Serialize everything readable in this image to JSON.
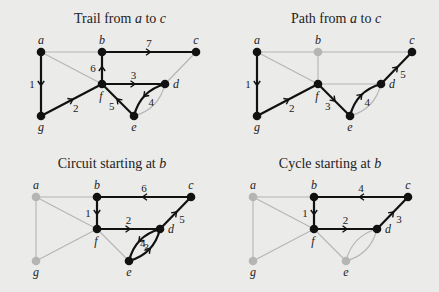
{
  "colors": {
    "background": "#ebebea",
    "active": "#111111",
    "inactive": "#b5b5b5"
  },
  "panels": [
    {
      "id": "trail",
      "title_prefix": "Trail from ",
      "title_var1": "a",
      "title_mid": " to ",
      "title_var2": "c",
      "offset": [
        0,
        0
      ],
      "active_nodes": [
        "a",
        "b",
        "c",
        "d",
        "e",
        "f",
        "g"
      ],
      "steps": [
        {
          "n": "1",
          "from": "a",
          "to": "g",
          "edge": "a-g"
        },
        {
          "n": "2",
          "from": "g",
          "to": "f",
          "edge": "g-f"
        },
        {
          "n": "3",
          "from": "f",
          "to": "d",
          "edge": "f-d"
        },
        {
          "n": "4",
          "from": "d",
          "to": "e",
          "edge": "d-e-lower"
        },
        {
          "n": "5",
          "from": "e",
          "to": "f",
          "edge": "f-e"
        },
        {
          "n": "6",
          "from": "f",
          "to": "b",
          "edge": "b-f"
        },
        {
          "n": "7",
          "from": "b",
          "to": "c",
          "edge": "b-c"
        }
      ]
    },
    {
      "id": "path",
      "title_prefix": "Path from ",
      "title_var1": "a",
      "title_mid": " to ",
      "title_var2": "c",
      "offset": [
        216,
        0
      ],
      "active_nodes": [
        "a",
        "c",
        "d",
        "e",
        "f",
        "g"
      ],
      "steps": [
        {
          "n": "1",
          "from": "a",
          "to": "g",
          "edge": "a-g"
        },
        {
          "n": "2",
          "from": "g",
          "to": "f",
          "edge": "g-f"
        },
        {
          "n": "3",
          "from": "f",
          "to": "e",
          "edge": "f-e"
        },
        {
          "n": "4",
          "from": "e",
          "to": "d",
          "edge": "d-e-lower"
        },
        {
          "n": "5",
          "from": "d",
          "to": "c",
          "edge": "d-c"
        }
      ]
    },
    {
      "id": "circuit",
      "title_prefix": "Circuit starting at ",
      "title_var1": "b",
      "title_mid": "",
      "title_var2": "",
      "offset": [
        -5,
        145
      ],
      "active_nodes": [
        "b",
        "c",
        "d",
        "e",
        "f"
      ],
      "steps": [
        {
          "n": "1",
          "from": "b",
          "to": "f",
          "edge": "b-f"
        },
        {
          "n": "2",
          "from": "f",
          "to": "d",
          "edge": "f-d"
        },
        {
          "n": "3",
          "from": "d",
          "to": "e",
          "edge": "d-e-lower"
        },
        {
          "n": "4",
          "from": "e",
          "to": "d",
          "edge": "d-e-upper"
        },
        {
          "n": "5",
          "from": "d",
          "to": "c",
          "edge": "d-c"
        },
        {
          "n": "6",
          "from": "c",
          "to": "b",
          "edge": "b-c"
        }
      ]
    },
    {
      "id": "cycle",
      "title_prefix": "Cycle starting at ",
      "title_var1": "b",
      "title_mid": "",
      "title_var2": "",
      "offset": [
        212,
        145
      ],
      "active_nodes": [
        "b",
        "c",
        "d",
        "f"
      ],
      "steps": [
        {
          "n": "1",
          "from": "b",
          "to": "f",
          "edge": "b-f"
        },
        {
          "n": "2",
          "from": "f",
          "to": "d",
          "edge": "f-d"
        },
        {
          "n": "3",
          "from": "d",
          "to": "c",
          "edge": "d-c"
        },
        {
          "n": "4",
          "from": "c",
          "to": "b",
          "edge": "b-c"
        }
      ]
    }
  ],
  "graph": {
    "nodes": {
      "a": {
        "x": 41,
        "y": 52,
        "label_dx": 0,
        "label_dy": -8
      },
      "b": {
        "x": 102,
        "y": 52,
        "label_dx": 0,
        "label_dy": -8
      },
      "c": {
        "x": 196,
        "y": 52,
        "label_dx": 0,
        "label_dy": -8
      },
      "d": {
        "x": 165,
        "y": 84,
        "label_dx": 11,
        "label_dy": 4
      },
      "e": {
        "x": 134,
        "y": 116,
        "label_dx": 0,
        "label_dy": 15
      },
      "f": {
        "x": 102,
        "y": 84,
        "label_dx": -1,
        "label_dy": 16
      },
      "g": {
        "x": 41,
        "y": 116,
        "label_dx": 0,
        "label_dy": 15
      }
    },
    "edges": [
      {
        "id": "a-b",
        "u": "a",
        "v": "b"
      },
      {
        "id": "b-c",
        "u": "b",
        "v": "c"
      },
      {
        "id": "a-g",
        "u": "a",
        "v": "g"
      },
      {
        "id": "a-f",
        "u": "a",
        "v": "f"
      },
      {
        "id": "b-f",
        "u": "b",
        "v": "f"
      },
      {
        "id": "g-f",
        "u": "g",
        "v": "f"
      },
      {
        "id": "f-d",
        "u": "f",
        "v": "d"
      },
      {
        "id": "f-e",
        "u": "f",
        "v": "e"
      },
      {
        "id": "d-c",
        "u": "d",
        "v": "c"
      },
      {
        "id": "d-e-upper",
        "u": "d",
        "v": "e",
        "bend": -1
      },
      {
        "id": "d-e-lower",
        "u": "d",
        "v": "e",
        "bend": 1
      }
    ]
  }
}
